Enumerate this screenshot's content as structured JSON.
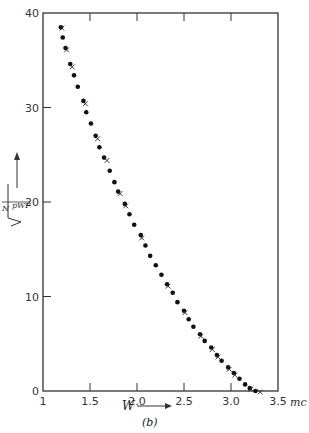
{
  "chart_data": {
    "type": "scatter",
    "title": "",
    "caption": "(b)",
    "xlabel": "W",
    "xunit": "mc",
    "ylabel": "sqrt(N / (pWF))",
    "ylabel_parts": {
      "num": "N",
      "den": "pWF"
    },
    "xlim": [
      1,
      3.5
    ],
    "ylim": [
      0,
      40
    ],
    "xticks": [
      1,
      1.5,
      2.0,
      2.5,
      3.0,
      3.5
    ],
    "xtick_labels": [
      "1",
      "1.5",
      "2.0",
      "2.5",
      "3.0",
      "3.5"
    ],
    "yticks": [
      0,
      10,
      20,
      30,
      40
    ],
    "ytick_labels": [
      "0",
      "10",
      "20",
      "30",
      "40"
    ],
    "grid": false,
    "legend": null,
    "series": [
      {
        "name": "dots",
        "marker": "circle",
        "x": [
          1.19,
          1.21,
          1.24,
          1.29,
          1.33,
          1.37,
          1.43,
          1.46,
          1.51,
          1.56,
          1.6,
          1.65,
          1.71,
          1.76,
          1.8,
          1.87,
          1.92,
          1.97,
          2.04,
          2.09,
          2.14,
          2.2,
          2.26,
          2.32,
          2.38,
          2.43,
          2.5,
          2.55,
          2.6,
          2.67,
          2.72,
          2.79,
          2.85,
          2.9,
          2.97,
          3.03,
          3.09,
          3.15,
          3.2,
          3.26
        ],
        "y": [
          38.5,
          37.4,
          36.3,
          34.6,
          33.4,
          32.2,
          30.7,
          29.5,
          28.3,
          27.0,
          25.8,
          24.7,
          23.3,
          22.1,
          21.1,
          19.8,
          18.7,
          17.6,
          16.5,
          15.4,
          14.3,
          13.3,
          12.3,
          11.3,
          10.4,
          9.4,
          8.5,
          7.6,
          6.8,
          6.0,
          5.3,
          4.6,
          3.8,
          3.2,
          2.5,
          1.9,
          1.3,
          0.7,
          0.3,
          0.0
        ]
      },
      {
        "name": "crosses",
        "marker": "x",
        "x": [
          1.19,
          1.24,
          1.3,
          1.44,
          1.57,
          1.67,
          1.81,
          1.87,
          2.04,
          2.32,
          2.5,
          2.67,
          2.79,
          2.85,
          2.97,
          3.03,
          3.2,
          3.3
        ],
        "y": [
          38.5,
          36.2,
          34.4,
          30.5,
          26.8,
          24.5,
          21.0,
          19.7,
          16.3,
          11.2,
          8.4,
          5.9,
          4.5,
          3.7,
          2.4,
          1.8,
          0.3,
          0.0
        ]
      }
    ]
  }
}
